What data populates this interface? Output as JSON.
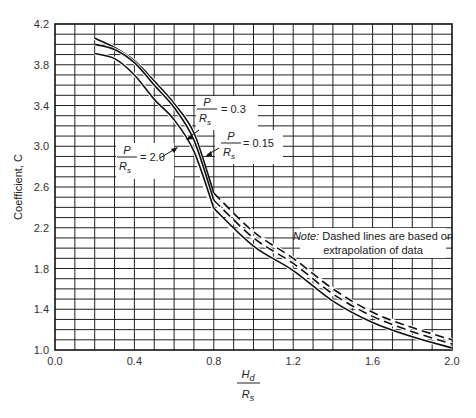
{
  "chart_data": {
    "type": "line",
    "title": "",
    "xlabel": "H_d / R_s",
    "xlabel_num": "H",
    "xlabel_num_sub": "d",
    "xlabel_den": "R",
    "xlabel_den_sub": "s",
    "ylabel": "Coefficient, C",
    "xlim": [
      0.0,
      2.0
    ],
    "ylim": [
      1.0,
      4.2
    ],
    "xticks": [
      "0.0",
      "0.4",
      "0.8",
      "1.2",
      "1.6",
      "2.0"
    ],
    "yticks": [
      "1.0",
      "1.4",
      "1.8",
      "2.2",
      "2.6",
      "3.0",
      "3.4",
      "3.8",
      "4.2"
    ],
    "grid": true,
    "grid_step_x": 0.1,
    "grid_step_y": 0.1,
    "x": [
      0.2,
      0.3,
      0.4,
      0.5,
      0.6,
      0.7,
      0.8,
      1.0,
      1.2,
      1.4,
      1.6,
      1.8,
      2.0
    ],
    "dashed_from_x": 0.8,
    "series": [
      {
        "name": "P/Rs = 0.15",
        "values": [
          4.06,
          3.97,
          3.84,
          3.64,
          3.42,
          3.13,
          2.54,
          2.16,
          1.9,
          1.6,
          1.37,
          1.22,
          1.1
        ],
        "extrapolated_style": "dashed"
      },
      {
        "name": "P/Rs = 0.3",
        "values": [
          4.0,
          3.95,
          3.82,
          3.6,
          3.38,
          3.06,
          2.47,
          2.1,
          1.85,
          1.55,
          1.33,
          1.18,
          1.06
        ],
        "extrapolated_style": "dashed"
      },
      {
        "name": "P/Rs = 2.0",
        "values": [
          3.91,
          3.86,
          3.7,
          3.46,
          3.26,
          2.95,
          2.39,
          2.02,
          1.78,
          1.48,
          1.27,
          1.13,
          1.02
        ],
        "extrapolated_style": "solid"
      }
    ],
    "annotations": [
      {
        "id": "p03",
        "num": "P",
        "den": "R",
        "den_sub": "s",
        "value": "= 0.3"
      },
      {
        "id": "p015",
        "num": "P",
        "den": "R",
        "den_sub": "s",
        "value": "= 0.15"
      },
      {
        "id": "p20",
        "num": "P",
        "den": "R",
        "den_sub": "s",
        "value": "= 2.0"
      }
    ],
    "note": {
      "prefix": "Note:",
      "line1": " Dashed lines are based on",
      "line2": "extrapolation of data"
    }
  }
}
